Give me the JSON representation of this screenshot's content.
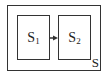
{
  "diagram": {
    "outer": {
      "label": "S"
    },
    "nodes": [
      {
        "id": "S1",
        "base": "S",
        "sub": "1"
      },
      {
        "id": "S2",
        "base": "S",
        "sub": "2"
      }
    ],
    "edges": [
      {
        "from": "S1",
        "to": "S2"
      }
    ],
    "colors": {
      "stroke": "#333333",
      "text": "#222222"
    }
  }
}
